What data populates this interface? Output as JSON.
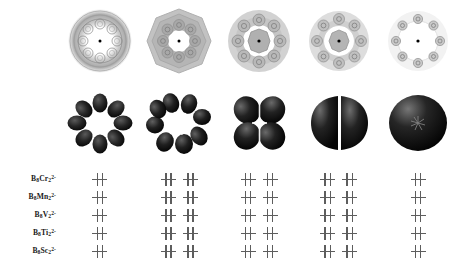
{
  "figure": {
    "title": "",
    "background_color": "#ffffff",
    "level_color": "#5d5d5d",
    "orbital_color": "#1c1c1c",
    "contour_color": "#9a9a9a"
  },
  "columns": [
    {
      "index": 1,
      "orbital_label": "8-lobed-orbital",
      "contour_label": "density-contour-complex",
      "lobe_count": 8,
      "mo_count": 1
    },
    {
      "index": 2,
      "orbital_label": "8-lobed-orbital-phase-b",
      "contour_label": "density-contour-octagonal",
      "lobe_count": 8,
      "mo_count": 2
    },
    {
      "index": 3,
      "orbital_label": "4-lobed-delta-orbital",
      "contour_label": "density-contour-ringed",
      "lobe_count": 4,
      "mo_count": 2
    },
    {
      "index": 4,
      "orbital_label": "2-lobed-pi-orbital",
      "contour_label": "density-contour-sparse",
      "lobe_count": 2,
      "mo_count": 2
    },
    {
      "index": 5,
      "orbital_label": "spherical-sigma-orbital",
      "contour_label": "density-contour-diffuse",
      "lobe_count": 1,
      "mo_count": 1
    }
  ],
  "species": [
    {
      "formula_html": "B<sub>8</sub>Cr<sub>2</sub><sup>2-</sup>",
      "formula_text": "B8Cr2 2-",
      "name": "octaboron-dichromium-dianion"
    },
    {
      "formula_html": "B<sub>8</sub>Mn<sub>2</sub><sup>2-</sup>",
      "formula_text": "B8Mn2 2-",
      "name": "octaboron-dimanganese-dianion"
    },
    {
      "formula_html": "B<sub>8</sub>V<sub>2</sub><sup>2-</sup>",
      "formula_text": "B8V2 2-",
      "name": "octaboron-divanadium-dianion"
    },
    {
      "formula_html": "B<sub>8</sub>Ti<sub>2</sub><sup>2-</sup>",
      "formula_text": "B8Ti2 2-",
      "name": "octaboron-dititanium-dianion"
    },
    {
      "formula_html": "B<sub>8</sub>Sc<sub>2</sub><sup>2-</sup>",
      "formula_text": "B8Sc2 2-",
      "name": "octaboron-discandium-dianion"
    }
  ],
  "occupancy": {
    "pattern_per_column": [
      1,
      2,
      2,
      2,
      1
    ],
    "rows": [
      {
        "species": "B8Cr2 2-",
        "levels": [
          1,
          2,
          2,
          2,
          1
        ]
      },
      {
        "species": "B8Mn2 2-",
        "levels": [
          1,
          2,
          2,
          2,
          1
        ]
      },
      {
        "species": "B8V2 2-",
        "levels": [
          1,
          2,
          2,
          2,
          1
        ]
      },
      {
        "species": "B8Ti2 2-",
        "levels": [
          1,
          2,
          2,
          2,
          1
        ]
      },
      {
        "species": "B8Sc2 2-",
        "levels": [
          1,
          2,
          2,
          2,
          1
        ]
      }
    ],
    "electrons_per_level": 2,
    "spin_notation": "paired"
  }
}
